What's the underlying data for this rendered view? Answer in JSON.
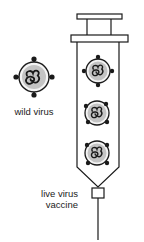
{
  "labels": {
    "wild_virus": "wild virus",
    "vaccine_line1": "live virus",
    "vaccine_line2": "vaccine"
  },
  "colors": {
    "stroke": "#1a1a1a",
    "virus_fill": "#c4c4c4",
    "virus_ring": "#f4f4f4",
    "background": "#ffffff"
  },
  "figures": {
    "wild_virus": {
      "cx": 34,
      "cy": 77,
      "r": 15
    },
    "syringe_viruses": [
      {
        "cx": 98,
        "cy": 71,
        "r": 12
      },
      {
        "cx": 97,
        "cy": 113,
        "r": 12
      },
      {
        "cx": 97,
        "cy": 153,
        "r": 12
      }
    ]
  }
}
